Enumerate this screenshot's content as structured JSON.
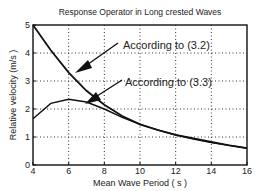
{
  "chart_data": {
    "type": "line",
    "title": "Response Operator in Long crested Waves",
    "xlabel": "Mean Wave Period ( s )",
    "ylabel": "Relative velocity (m/s )",
    "xlim": [
      4,
      16
    ],
    "ylim": [
      0,
      5
    ],
    "xticks": [
      4,
      6,
      8,
      10,
      12,
      14,
      16
    ],
    "yticks": [
      0,
      1,
      2,
      3,
      4,
      5
    ],
    "grid": true,
    "series": [
      {
        "name": "According to (3.2)",
        "x": [
          4,
          5,
          6,
          7,
          8,
          9,
          10,
          11,
          12,
          13,
          14,
          15,
          16
        ],
        "values": [
          5.0,
          4.1,
          3.3,
          2.65,
          2.15,
          1.75,
          1.45,
          1.25,
          1.08,
          0.95,
          0.82,
          0.7,
          0.6
        ]
      },
      {
        "name": "According to (3.3)",
        "x": [
          4,
          5,
          6,
          7,
          8,
          9,
          10,
          11,
          12,
          13,
          14,
          15,
          16
        ],
        "values": [
          1.65,
          2.2,
          2.35,
          2.25,
          2.0,
          1.7,
          1.45,
          1.25,
          1.07,
          0.93,
          0.8,
          0.7,
          0.6
        ]
      }
    ],
    "annotations": [
      {
        "text": "According to (3.2)",
        "points_to_series": 0,
        "label_x": 8.9,
        "label_y": 4.25
      },
      {
        "text": "According to (3.3)",
        "points_to_series": 1,
        "label_x": 9.0,
        "label_y": 2.95
      }
    ]
  }
}
